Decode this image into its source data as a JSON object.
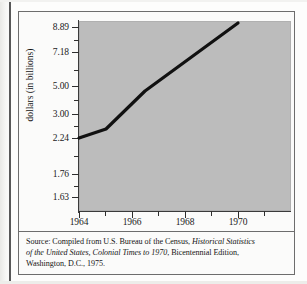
{
  "figure": {
    "plot_background_color": "#bcbcbc",
    "page_background_color": "#fbfbfa",
    "line_color": "#111111",
    "border_color": "#6d6d6d"
  },
  "axis_titles": {
    "y": "dollars (in billions)",
    "x": ""
  },
  "source_note": {
    "line1_prefix": "Source: Compiled from U.S. Bureau of the Census, ",
    "line1_italic": "Historical Statistics",
    "line2_italic": "of the United States, Colonial Times to 1970",
    "line2_suffix": ", Bicentennial Edition,",
    "line3": "Washington, D.C., 1975."
  },
  "chart_data": {
    "type": "line",
    "title": "",
    "subtitle": "",
    "xlabel": "",
    "ylabel": "dollars (in billions)",
    "grid": false,
    "legend": "none",
    "x": [
      1964,
      1965,
      1969
    ],
    "y": [
      2.24,
      2.62,
      8.7
    ],
    "series": [
      {
        "name": "dollars (in billions)",
        "x": [
          1964,
          1965,
          1969
        ],
        "values": [
          2.24,
          2.62,
          8.7
        ]
      }
    ],
    "xlim": [
      1964,
      1970
    ],
    "ylim": [
      1.63,
      8.89
    ],
    "y_tick_labels": [
      "8.89",
      "7.18",
      "5.00",
      "3.00",
      "2.24",
      "1.76",
      "1.63"
    ],
    "y_tick_values": [
      8.89,
      7.18,
      5.0,
      3.0,
      2.24,
      1.76,
      1.63
    ],
    "y_tick_pixel_tops": [
      15,
      40,
      74,
      102,
      126,
      162,
      185
    ],
    "y_minor_tick_pixel_tops": [
      28,
      58,
      88,
      114,
      144,
      174
    ],
    "x_tick_labels": [
      "1964",
      "1966",
      "1968",
      "1970"
    ],
    "x_tick_values": [
      1964,
      1966,
      1968,
      1970
    ],
    "x_tick_pixel_lefts": [
      60,
      113,
      166,
      219
    ],
    "x_minor_tick_pixel_lefts": [
      86,
      139,
      192,
      245
    ],
    "line_points_px": [
      [
        60,
        126
      ],
      [
        87,
        117
      ],
      [
        126,
        79
      ],
      [
        219,
        11
      ]
    ],
    "note": "y-axis uses non-linear (ratio/probability-style) spacing"
  }
}
